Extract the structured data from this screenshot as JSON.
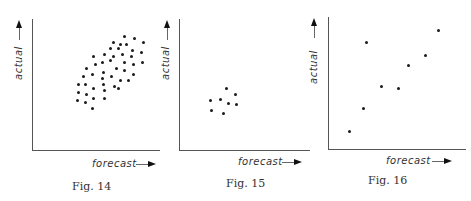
{
  "figures": [
    {
      "caption": "Fig. 14",
      "xlabel": "forecast",
      "ylabel": "actual"
    },
    {
      "caption": "Fig. 15",
      "xlabel": "forecast",
      "ylabel": "actual"
    },
    {
      "caption": "Fig. 16",
      "xlabel": "forecast",
      "ylabel": "actual"
    }
  ],
  "chart_data": [
    {
      "type": "scatter",
      "title": "Fig. 14",
      "xlabel": "forecast",
      "ylabel": "actual",
      "grid": false,
      "description": "Dense elliptical cloud of points along a positive diagonal (wide band)",
      "points_px": [
        [
          124,
          36
        ],
        [
          134,
          38
        ],
        [
          113,
          42
        ],
        [
          120,
          44
        ],
        [
          126,
          44
        ],
        [
          143,
          42
        ],
        [
          110,
          48
        ],
        [
          118,
          48
        ],
        [
          132,
          50
        ],
        [
          104,
          54
        ],
        [
          113,
          56
        ],
        [
          122,
          54
        ],
        [
          131,
          56
        ],
        [
          141,
          52
        ],
        [
          93,
          56
        ],
        [
          102,
          62
        ],
        [
          110,
          60
        ],
        [
          124,
          62
        ],
        [
          133,
          64
        ],
        [
          142,
          62
        ],
        [
          86,
          68
        ],
        [
          95,
          64
        ],
        [
          103,
          72
        ],
        [
          116,
          68
        ],
        [
          124,
          70
        ],
        [
          133,
          74
        ],
        [
          83,
          76
        ],
        [
          92,
          74
        ],
        [
          102,
          78
        ],
        [
          111,
          76
        ],
        [
          120,
          80
        ],
        [
          128,
          80
        ],
        [
          78,
          84
        ],
        [
          85,
          84
        ],
        [
          93,
          88
        ],
        [
          103,
          84
        ],
        [
          114,
          86
        ],
        [
          118,
          88
        ],
        [
          78,
          92
        ],
        [
          86,
          94
        ],
        [
          93,
          98
        ],
        [
          104,
          90
        ],
        [
          77,
          100
        ],
        [
          85,
          102
        ],
        [
          92,
          108
        ],
        [
          104,
          98
        ]
      ]
    },
    {
      "type": "scatter",
      "title": "Fig. 15",
      "xlabel": "forecast",
      "ylabel": "actual",
      "grid": false,
      "description": "Small tight cluster of points near centre-left of plot",
      "points_px": [
        [
          226,
          88
        ],
        [
          235,
          94
        ],
        [
          210,
          100
        ],
        [
          220,
          99
        ],
        [
          228,
          103
        ],
        [
          236,
          104
        ],
        [
          211,
          110
        ],
        [
          223,
          113
        ]
      ]
    },
    {
      "type": "scatter",
      "title": "Fig. 16",
      "xlabel": "forecast",
      "ylabel": "actual",
      "grid": false,
      "description": "Sparse points with positive trend and one outlier at upper-left",
      "points_px": [
        [
          438,
          30
        ],
        [
          366,
          42
        ],
        [
          425,
          55
        ],
        [
          408,
          65
        ],
        [
          381,
          86
        ],
        [
          398,
          88
        ],
        [
          363,
          108
        ],
        [
          349,
          131
        ]
      ]
    }
  ]
}
